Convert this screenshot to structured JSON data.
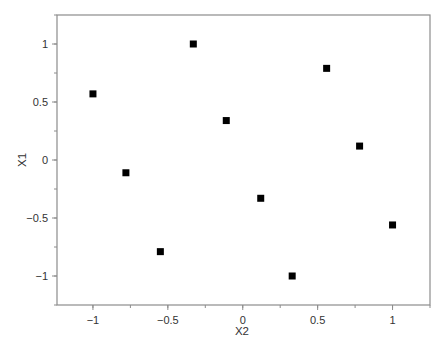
{
  "chart_data": {
    "type": "scatter",
    "title": "",
    "xlabel": "X2",
    "ylabel": "X1",
    "xlim": [
      -1.24,
      1.25
    ],
    "ylim": [
      -1.25,
      1.25
    ],
    "grid": false,
    "legend": null,
    "marker": "square",
    "marker_color": "#000000",
    "axis_color": "#8c8c8c",
    "x_ticks": [
      -1,
      -0.5,
      0,
      0.5,
      1
    ],
    "x_tick_labels": [
      "−1",
      "−0.5",
      "0",
      "0.5",
      "1"
    ],
    "y_ticks": [
      1,
      0.5,
      0,
      -0.5,
      -1
    ],
    "y_tick_labels": [
      "1",
      "0.5",
      "0",
      "−0.5",
      "−1"
    ],
    "x_minor_step": 0.25,
    "y_minor_step": 0.25,
    "series": [
      {
        "name": "points",
        "points": [
          {
            "x": -1.0,
            "y": 0.57
          },
          {
            "x": -0.78,
            "y": -0.11
          },
          {
            "x": -0.55,
            "y": -0.79
          },
          {
            "x": -0.33,
            "y": 1.0
          },
          {
            "x": -0.11,
            "y": 0.34
          },
          {
            "x": 0.12,
            "y": -0.33
          },
          {
            "x": 0.33,
            "y": -1.0
          },
          {
            "x": 0.56,
            "y": 0.79
          },
          {
            "x": 0.78,
            "y": 0.12
          },
          {
            "x": 1.0,
            "y": -0.56
          }
        ]
      }
    ]
  }
}
